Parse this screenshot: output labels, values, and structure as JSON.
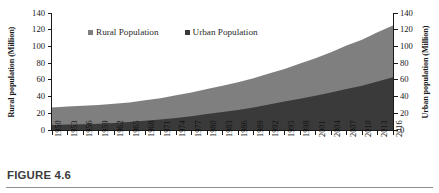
{
  "figure": {
    "caption_label": "FIGURE 4.6"
  },
  "legend": {
    "position": "top-center",
    "items": [
      {
        "label": "Rural Population",
        "color": "#7f7f7f",
        "icon": "square-marker-icon"
      },
      {
        "label": "Urban Population",
        "color": "#3a3a3a",
        "icon": "square-marker-icon"
      }
    ]
  },
  "axes": {
    "left": {
      "title": "Rural population (Million)",
      "ticks": [
        "0",
        "20",
        "40",
        "60",
        "80",
        "100",
        "120",
        "140"
      ],
      "min": 0,
      "max": 140
    },
    "right": {
      "title": "Urban population (Million)",
      "ticks": [
        "0",
        "20",
        "40",
        "60",
        "80",
        "100",
        "120",
        "140"
      ],
      "min": 0,
      "max": 140
    }
  },
  "chart_data": {
    "type": "area",
    "stacked": true,
    "title": "",
    "xlabel": "",
    "ylabel": "Rural population (Million)",
    "ylim": [
      0,
      140
    ],
    "ytick_step": 20,
    "grid": false,
    "legend_position": "top-center",
    "categories": [
      "1950",
      "1953",
      "1956",
      "1959",
      "1962",
      "1965",
      "1968",
      "1971",
      "1974",
      "1977",
      "1980",
      "1983",
      "1986",
      "1989",
      "1992",
      "1995",
      "1998",
      "2001",
      "2004",
      "2007",
      "2010",
      "2013",
      "2016"
    ],
    "x_tick_labels": [
      "1950",
      "1953",
      "1956",
      "1959",
      "1962",
      "1965",
      "1968",
      "1971",
      "1974",
      "1977",
      "1980",
      "1983",
      "1986",
      "1989",
      "1992",
      "1995",
      "1998",
      "2001",
      "2004",
      "2007",
      "2010",
      "2013",
      "2016"
    ],
    "series": [
      {
        "name": "Urban Population",
        "color": "#3a3a3a",
        "axis": "right",
        "values": [
          6,
          6.5,
          7,
          7.5,
          8.5,
          9.5,
          11,
          12.5,
          14.5,
          16.5,
          19,
          21.5,
          24,
          27,
          30.5,
          34,
          37.5,
          41,
          45,
          49,
          53,
          58,
          63
        ]
      },
      {
        "name": "Rural Population",
        "color": "#7f7f7f",
        "axis": "left",
        "values": [
          21,
          21.5,
          22,
          22.5,
          23,
          23.5,
          24.5,
          25.5,
          27,
          28.5,
          30,
          31.5,
          33,
          35,
          37,
          39.5,
          42,
          45,
          48,
          52,
          55,
          59,
          62
        ]
      }
    ],
    "stacked_totals": [
      27,
      28,
      29,
      30,
      31.5,
      33,
      35.5,
      38,
      41.5,
      45,
      49,
      53,
      57,
      62,
      67.5,
      73,
      79.5,
      86,
      93,
      101,
      108,
      117,
      125
    ]
  }
}
